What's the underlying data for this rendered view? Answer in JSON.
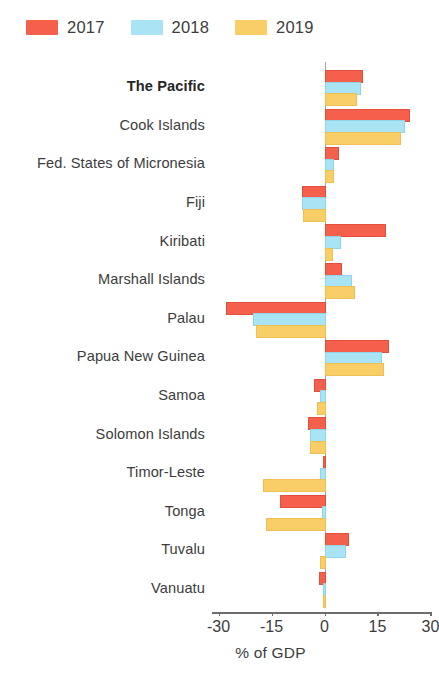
{
  "legend": {
    "position": "top-left",
    "entries": [
      {
        "label": "2017",
        "color": "#F4604C"
      },
      {
        "label": "2018",
        "color": "#A8E4F4"
      },
      {
        "label": "2019",
        "color": "#F9CE67"
      }
    ]
  },
  "axis": {
    "xlabel": "% of GDP",
    "ticks": [
      "-30",
      "-15",
      "0",
      "15",
      "30"
    ],
    "tick_values": [
      -30,
      -15,
      0,
      15,
      30
    ]
  },
  "chart_data": {
    "type": "bar",
    "orientation": "horizontal",
    "title": "",
    "subtitle": "",
    "xlabel": "% of GDP",
    "ylabel": "",
    "xlim": [
      -30,
      30
    ],
    "grid": false,
    "legend_position": "top-left",
    "categories": [
      "The Pacific",
      "Cook Islands",
      "Fed. States of Micronesia",
      "Fiji",
      "Kiribati",
      "Marshall Islands",
      "Palau",
      "Papua New Guinea",
      "Samoa",
      "Solomon Islands",
      "Timor-Leste",
      "Tonga",
      "Tuvalu",
      "Vanuatu"
    ],
    "highlighted_category": "The Pacific",
    "series": [
      {
        "name": "2017",
        "color": "#F4604C",
        "values": [
          10.4,
          23.5,
          3.5,
          -6.5,
          16.7,
          4.5,
          -27.8,
          17.6,
          -3.1,
          -4.8,
          -0.3,
          -12.7,
          6.5,
          -1.5
        ]
      },
      {
        "name": "2018",
        "color": "#A8E4F4",
        "values": [
          9.8,
          22.3,
          2.2,
          -6.5,
          4.0,
          7.1,
          -20.1,
          15.6,
          -1.2,
          -4.0,
          -1.4,
          -0.7,
          5.4,
          -0.5
        ]
      },
      {
        "name": "2019",
        "color": "#F9CE67",
        "values": [
          8.5,
          21.0,
          2.0,
          -6.2,
          1.7,
          8.0,
          -19.5,
          16.4,
          -2.0,
          -4.2,
          -17.5,
          -16.5,
          -1.2,
          -0.5
        ]
      }
    ]
  }
}
